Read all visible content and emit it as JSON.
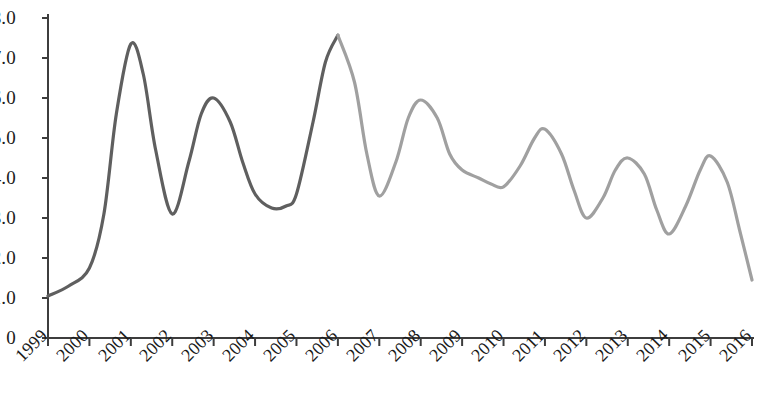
{
  "chart_data": {
    "type": "line",
    "title": "",
    "subtitle": "",
    "xlabel": "",
    "ylabel": "",
    "grid": false,
    "legend": "none",
    "xlim": [
      1999,
      2016
    ],
    "ylim": [
      0,
      8
    ],
    "y_ticks": [
      "8.0",
      "7.0",
      "6.0",
      "5.0",
      "4.0",
      "3.0",
      "2.0",
      "1.0",
      "0"
    ],
    "y_tick_values": [
      8,
      7,
      6,
      5,
      4,
      3,
      2,
      1,
      0
    ],
    "x_ticks": [
      "1999",
      "2000",
      "2001",
      "2002",
      "2003",
      "2004",
      "2005",
      "2006",
      "2007",
      "2008",
      "2009",
      "2010",
      "2011",
      "2012",
      "2013",
      "2014",
      "2015",
      "2016"
    ],
    "x_tick_values": [
      1999,
      2000,
      2001,
      2002,
      2003,
      2004,
      2005,
      2006,
      2007,
      2008,
      2009,
      2010,
      2011,
      2012,
      2013,
      2014,
      2015,
      2016
    ],
    "colors": {
      "segment_early": "#5f5f5f",
      "segment_late": "#a0a0a0",
      "axis": "#3d3d3d",
      "text": "#1a1a1a",
      "background": "#ffffff"
    },
    "series": [
      {
        "name": "early-segment",
        "color": "#5f5f5f",
        "x": [
          1999,
          1999.5,
          2000,
          2000.35,
          2000.65,
          2001,
          2001.3,
          2001.6,
          2002,
          2002.4,
          2002.7,
          2003,
          2003.4,
          2003.7,
          2004,
          2004.4,
          2004.75,
          2005,
          2005.4,
          2005.7,
          2006
        ],
        "values": [
          1.05,
          1.3,
          1.75,
          3.1,
          5.6,
          7.35,
          6.6,
          4.7,
          3.1,
          4.4,
          5.6,
          6.0,
          5.4,
          4.4,
          3.6,
          3.25,
          3.3,
          3.6,
          5.4,
          6.9,
          7.57
        ]
      },
      {
        "name": "late-segment",
        "color": "#a0a0a0",
        "x": [
          2006,
          2006.4,
          2006.7,
          2007,
          2007.4,
          2007.7,
          2008,
          2008.4,
          2008.7,
          2009,
          2009.4,
          2009.7,
          2010,
          2010.4,
          2010.75,
          2011,
          2011.4,
          2011.7,
          2012,
          2012.4,
          2012.7,
          2013,
          2013.4,
          2013.7,
          2014,
          2014.4,
          2014.75,
          2015,
          2015.4,
          2015.7,
          2016
        ],
        "values": [
          7.57,
          6.4,
          4.6,
          3.55,
          4.4,
          5.5,
          5.95,
          5.5,
          4.6,
          4.2,
          4.0,
          3.85,
          3.78,
          4.3,
          5.0,
          5.22,
          4.6,
          3.7,
          3.0,
          3.5,
          4.2,
          4.5,
          4.1,
          3.2,
          2.6,
          3.3,
          4.2,
          4.55,
          3.9,
          2.7,
          1.45
        ]
      }
    ],
    "annotations": [],
    "key_points": {
      "peak_2001": 7.35,
      "trough_2002": 3.1,
      "peak_2003": 6.0,
      "trough_2005": 3.25,
      "peak_2006": 7.57,
      "trough_2007": 3.55,
      "peak_2008": 5.95,
      "trough_2010": 3.78,
      "peak_2011": 5.22,
      "trough_2012": 3.0,
      "peak_2013": 4.5,
      "trough_2014": 2.6,
      "peak_2015": 4.55,
      "end_2016": 1.45,
      "start_1999": 1.05
    }
  }
}
